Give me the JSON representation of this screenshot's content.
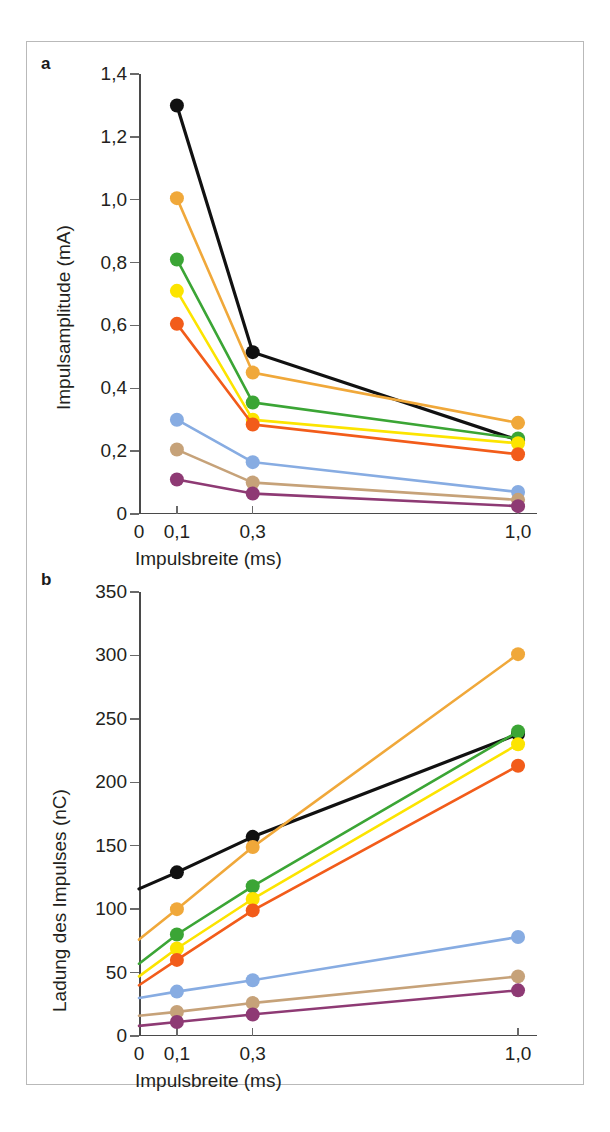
{
  "figure": {
    "panel_a_letter": "a",
    "panel_b_letter": "b",
    "caption": ""
  },
  "chart_data": [
    {
      "panel": "a",
      "type": "line",
      "title": "",
      "xlabel": "Impulsbreite (ms)",
      "ylabel": "Impulsamplitude (mA)",
      "x": [
        0.1,
        0.3,
        1.0
      ],
      "x_positions": [
        0.1,
        0.3,
        1.0
      ],
      "xlim": [
        0,
        1.05
      ],
      "ylim": [
        0,
        1.4
      ],
      "xticks": [
        0,
        0.1,
        0.3,
        1.0
      ],
      "xtick_labels": [
        "0",
        "0,1",
        "0,3",
        "1,0"
      ],
      "yticks": [
        0,
        0.2,
        0.4,
        0.6,
        0.8,
        1.0,
        1.2,
        1.4
      ],
      "ytick_labels": [
        "0",
        "0,2",
        "0,4",
        "0,6",
        "0,8",
        "1,0",
        "1,2",
        "1,4"
      ],
      "grid": false,
      "legend": "none",
      "series": [
        {
          "name": "black",
          "color": "#111111",
          "values": [
            1.3,
            0.515,
            0.235
          ]
        },
        {
          "name": "orange",
          "color": "#F0A83A",
          "values": [
            1.005,
            0.45,
            0.29
          ]
        },
        {
          "name": "green",
          "color": "#3BA535",
          "values": [
            0.81,
            0.355,
            0.24
          ]
        },
        {
          "name": "yellow",
          "color": "#FCE400",
          "values": [
            0.71,
            0.3,
            0.225
          ]
        },
        {
          "name": "red-orange",
          "color": "#F25C1A",
          "values": [
            0.605,
            0.285,
            0.19
          ]
        },
        {
          "name": "light-blue",
          "color": "#87ACE2",
          "values": [
            0.3,
            0.165,
            0.07
          ]
        },
        {
          "name": "tan",
          "color": "#C6A279",
          "values": [
            0.205,
            0.1,
            0.045
          ]
        },
        {
          "name": "purple",
          "color": "#8E3A74",
          "values": [
            0.11,
            0.065,
            0.025
          ]
        }
      ]
    },
    {
      "panel": "b",
      "type": "line",
      "title": "",
      "xlabel": "Impulsbreite (ms)",
      "ylabel": "Ladung des Impulses (nC)",
      "x": [
        0,
        0.1,
        0.3,
        1.0
      ],
      "xlim": [
        0,
        1.05
      ],
      "ylim": [
        0,
        350
      ],
      "xticks": [
        0,
        0.1,
        0.3,
        1.0
      ],
      "xtick_labels": [
        "0",
        "0,1",
        "0,3",
        "1,0"
      ],
      "yticks": [
        0,
        50,
        100,
        150,
        200,
        250,
        300,
        350
      ],
      "ytick_labels": [
        "0",
        "50",
        "100",
        "150",
        "200",
        "250",
        "300",
        "350"
      ],
      "grid": false,
      "legend": "none",
      "series": [
        {
          "name": "black",
          "color": "#111111",
          "values": [
            116,
            129,
            157,
            238
          ]
        },
        {
          "name": "orange",
          "color": "#F0A83A",
          "values": [
            76,
            100,
            149,
            301
          ]
        },
        {
          "name": "green",
          "color": "#3BA535",
          "values": [
            57,
            80,
            118,
            240
          ]
        },
        {
          "name": "yellow",
          "color": "#FCE400",
          "values": [
            47,
            69,
            108,
            230
          ]
        },
        {
          "name": "red-orange",
          "color": "#F25C1A",
          "values": [
            40,
            60,
            99,
            213
          ]
        },
        {
          "name": "light-blue",
          "color": "#87ACE2",
          "values": [
            30,
            35,
            44,
            78
          ]
        },
        {
          "name": "tan",
          "color": "#C6A279",
          "values": [
            16,
            19,
            26,
            47
          ]
        },
        {
          "name": "purple",
          "color": "#8E3A74",
          "values": [
            8,
            11,
            17,
            36
          ]
        }
      ]
    }
  ]
}
